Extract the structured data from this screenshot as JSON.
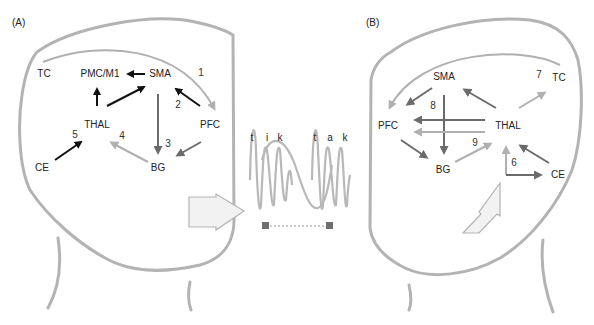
{
  "panels": {
    "A": {
      "label": "(A)",
      "nodes": {
        "tc": "TC",
        "pmc": "PMC/M1",
        "sma": "SMA",
        "thal": "THAL",
        "pfc": "PFC",
        "ce": "CE",
        "bg": "BG"
      },
      "numbers": [
        "1",
        "2",
        "3",
        "4",
        "5"
      ]
    },
    "B": {
      "label": "(B)",
      "nodes": {
        "sma": "SMA",
        "tc": "TC",
        "pfc": "PFC",
        "thal": "THAL",
        "bg": "BG",
        "ce": "CE"
      },
      "numbers": [
        "6",
        "7",
        "8",
        "9"
      ]
    }
  },
  "middle": {
    "syllables": [
      "t",
      "i",
      "k",
      "t",
      "a",
      "k"
    ]
  },
  "colors": {
    "outline": "#b3b3b3",
    "black_arrow": "#111111",
    "dark_gray_arrow": "#6b6b6b",
    "light_gray_arrow": "#b0b0b0",
    "big_arrow_fill": "#f2f2f2",
    "marker": "#6e6e6e"
  }
}
